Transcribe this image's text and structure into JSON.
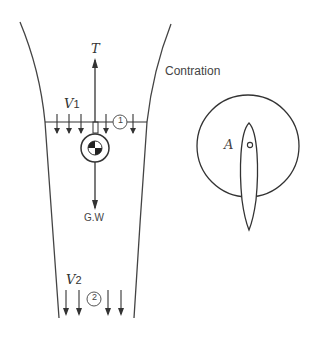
{
  "diagram": {
    "labels": {
      "thrust": "T",
      "weight": "G.W",
      "v1_main": "V",
      "v1_sub": "1",
      "v2_main": "V",
      "v2_sub": "2",
      "station1": "1",
      "station2": "2",
      "contraction": "Contration",
      "point_a": "A"
    },
    "colors": {
      "line": "#333333",
      "text": "#444444",
      "background": "#ffffff"
    }
  }
}
